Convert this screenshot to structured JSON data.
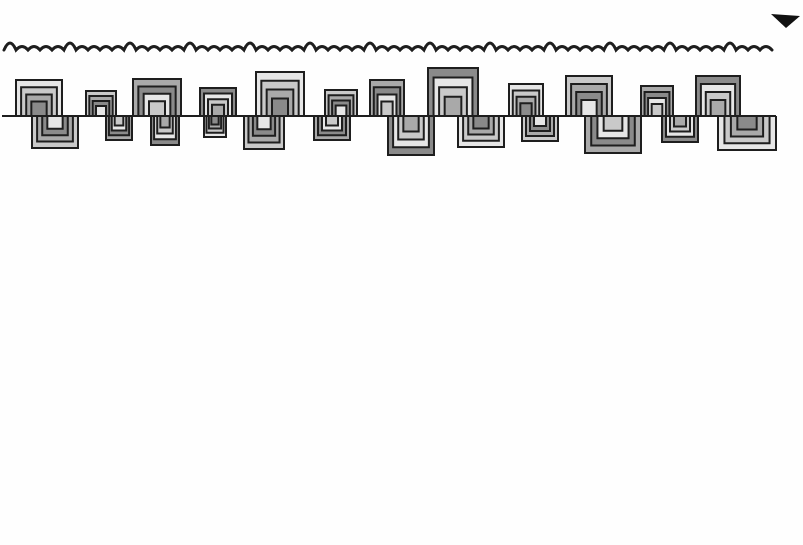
{
  "image": {
    "description": "Hand-drawn marker doodle on white paper: a wavy squiggle border above a horizontal line with alternating nested-square spiral meander shapes above and below",
    "background": "#fefefe",
    "ink": "#1e1e1e",
    "shades": [
      "#e6e6e6",
      "#c9c9c9",
      "#a9a9a9",
      "#8a8a8a"
    ],
    "baseline_y": 116,
    "baseline_x": [
      2,
      776
    ],
    "corner_mark": "black triangular ink smudge at top-right corner"
  },
  "shapes_up": [
    {
      "x": 16,
      "w": 46,
      "top": 80
    },
    {
      "x": 86,
      "w": 30,
      "top": 91
    },
    {
      "x": 133,
      "w": 48,
      "top": 79
    },
    {
      "x": 200,
      "w": 36,
      "top": 88
    },
    {
      "x": 256,
      "w": 48,
      "top": 72
    },
    {
      "x": 325,
      "w": 32,
      "top": 90
    },
    {
      "x": 370,
      "w": 34,
      "top": 80
    },
    {
      "x": 428,
      "w": 50,
      "top": 68
    },
    {
      "x": 509,
      "w": 34,
      "top": 84
    },
    {
      "x": 566,
      "w": 46,
      "top": 76
    },
    {
      "x": 641,
      "w": 32,
      "top": 86
    },
    {
      "x": 696,
      "w": 44,
      "top": 76
    }
  ],
  "shapes_down": [
    {
      "x": 32,
      "w": 46,
      "bottom": 148
    },
    {
      "x": 106,
      "w": 26,
      "bottom": 140
    },
    {
      "x": 151,
      "w": 28,
      "bottom": 145
    },
    {
      "x": 204,
      "w": 22,
      "bottom": 137
    },
    {
      "x": 244,
      "w": 40,
      "bottom": 149
    },
    {
      "x": 314,
      "w": 36,
      "bottom": 140
    },
    {
      "x": 388,
      "w": 46,
      "bottom": 155
    },
    {
      "x": 458,
      "w": 46,
      "bottom": 147
    },
    {
      "x": 522,
      "w": 36,
      "bottom": 141
    },
    {
      "x": 585,
      "w": 56,
      "bottom": 153
    },
    {
      "x": 662,
      "w": 36,
      "bottom": 142
    },
    {
      "x": 718,
      "w": 58,
      "bottom": 150
    }
  ]
}
